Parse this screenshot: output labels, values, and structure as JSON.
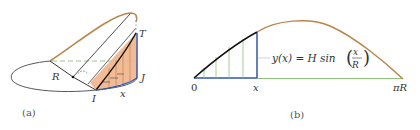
{
  "panel_a": {
    "caption": "(a)",
    "labels": {
      "T": "T",
      "J": "J",
      "I": "I",
      "R": "R",
      "x": "x"
    }
  },
  "panel_b": {
    "caption": "(b)",
    "axis_labels": {
      "origin": "0",
      "x": "x",
      "end": "πR"
    },
    "equation": {
      "lhs": "y(x) = H sin",
      "numerator": "x",
      "denominator": "R"
    }
  },
  "colors": {
    "arc_orange": "#b8864a",
    "blue": "#3355aa",
    "green": "#8fc27a",
    "fill_orange": "#f2b48a",
    "black": "#111111",
    "ellipse": "#444444"
  }
}
